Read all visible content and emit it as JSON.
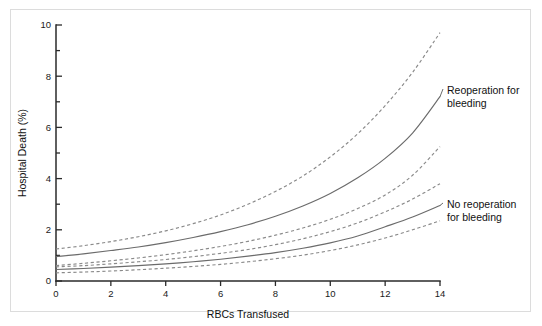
{
  "figure": {
    "background_color": "#ffffff",
    "border_color": "#dcdcdc"
  },
  "chart_data": {
    "type": "line",
    "title": "",
    "subtitle": "",
    "xlabel": "RBCs Transfused",
    "ylabel": "Hospital Death (%)",
    "xlim": [
      0,
      14
    ],
    "ylim": [
      0,
      10
    ],
    "x_major_ticks": [
      0,
      2,
      4,
      6,
      8,
      10,
      12,
      14
    ],
    "x_tick_labels": [
      "0",
      "2",
      "4",
      "6",
      "8",
      "10",
      "12",
      "14"
    ],
    "y_major_ticks": [
      0,
      2,
      4,
      6,
      8,
      10
    ],
    "y_tick_labels": [
      "0",
      "2",
      "4",
      "6",
      "8",
      "10"
    ],
    "y_minor_ticks": [
      1,
      3,
      5,
      7,
      9
    ],
    "grid": false,
    "legend_position": "inline-annotations",
    "x": [
      0,
      1,
      2,
      3,
      4,
      5,
      6,
      7,
      8,
      9,
      10,
      11,
      12,
      13,
      14
    ],
    "series": [
      {
        "name": "Reoperation for bleeding — upper 95% CI",
        "style": "dashed",
        "color": "#8a8a8a",
        "values": [
          1.25,
          1.38,
          1.54,
          1.73,
          1.96,
          2.24,
          2.58,
          3.0,
          3.5,
          4.1,
          4.85,
          5.75,
          6.85,
          8.15,
          9.7
        ]
      },
      {
        "name": "Reoperation for bleeding — estimate",
        "style": "solid",
        "color": "#6b6b6b",
        "values": [
          0.95,
          1.06,
          1.19,
          1.33,
          1.5,
          1.7,
          1.93,
          2.2,
          2.53,
          2.93,
          3.42,
          4.03,
          4.79,
          5.78,
          7.2
        ]
      },
      {
        "name": "Reoperation for bleeding — lower 95% CI",
        "style": "dashed",
        "color": "#8a8a8a",
        "values": [
          0.6,
          0.69,
          0.79,
          0.9,
          1.03,
          1.18,
          1.35,
          1.55,
          1.79,
          2.07,
          2.41,
          2.83,
          3.36,
          4.13,
          5.25
        ]
      },
      {
        "name": "No reoperation for bleeding — upper 95% CI",
        "style": "dashed",
        "color": "#8a8a8a",
        "values": [
          0.55,
          0.6,
          0.67,
          0.75,
          0.84,
          0.95,
          1.08,
          1.23,
          1.42,
          1.65,
          1.93,
          2.27,
          2.7,
          3.2,
          3.8
        ]
      },
      {
        "name": "No reoperation for bleeding — estimate",
        "style": "solid",
        "color": "#6b6b6b",
        "values": [
          0.45,
          0.49,
          0.54,
          0.6,
          0.67,
          0.75,
          0.85,
          0.97,
          1.11,
          1.28,
          1.49,
          1.76,
          2.12,
          2.5,
          2.95
        ]
      },
      {
        "name": "No reoperation for bleeding — lower 95% CI",
        "style": "dashed",
        "color": "#8a8a8a",
        "values": [
          0.32,
          0.35,
          0.39,
          0.44,
          0.5,
          0.57,
          0.65,
          0.75,
          0.87,
          1.01,
          1.19,
          1.41,
          1.68,
          2.0,
          2.35
        ]
      }
    ],
    "annotations": [
      {
        "id": "reoperation",
        "line1": "Reoperation for",
        "line2": "bleeding",
        "attach_x": 14.0,
        "attach_y": 7.2
      },
      {
        "id": "no-reoperation",
        "line1": "No reoperation",
        "line2": "for bleeding",
        "attach_x": 14.0,
        "attach_y": 2.95
      }
    ]
  }
}
